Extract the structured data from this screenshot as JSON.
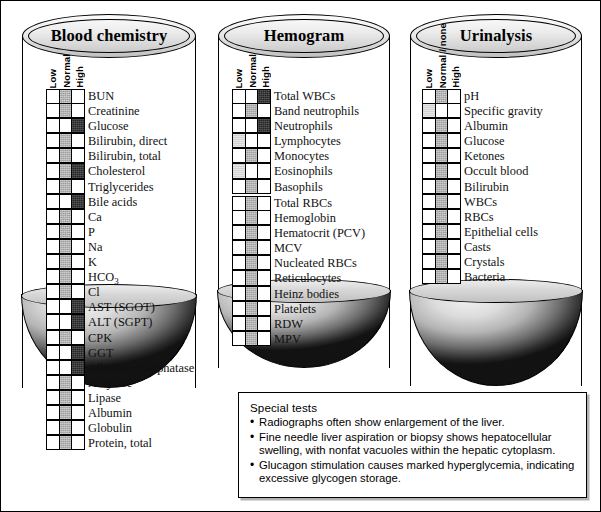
{
  "figure": {
    "title_hidden": "Laboratory test result panels"
  },
  "panels": [
    {
      "id": "blood-chemistry",
      "title": "Blood chemistry",
      "column_headers": [
        "Low",
        "Normal",
        "High"
      ],
      "groups": [
        {
          "rows": [
            {
              "label": "BUN",
              "state": "normal"
            },
            {
              "label": "Creatinine",
              "state": "normal"
            },
            {
              "label": "Glucose",
              "state": "high"
            },
            {
              "label": "Bilirubin, direct",
              "state": "normal"
            },
            {
              "label": "Bilirubin, total",
              "state": "normal"
            },
            {
              "label": "Cholesterol",
              "state": "normal-high"
            },
            {
              "label": "Triglycerides",
              "state": "normal"
            },
            {
              "label": "Bile acids",
              "state": "high"
            },
            {
              "label": "Ca",
              "state": "normal"
            },
            {
              "label": "P",
              "state": "normal"
            },
            {
              "label": "Na",
              "state": "normal"
            },
            {
              "label": "K",
              "state": "normal"
            },
            {
              "label": "HCO3",
              "state": "normal"
            },
            {
              "label": "Cl",
              "state": "normal"
            },
            {
              "label": "AST (SGOT)",
              "state": "high"
            },
            {
              "label": "ALT (SGPT)",
              "state": "high"
            },
            {
              "label": "CPK",
              "state": "normal"
            },
            {
              "label": "GGT",
              "state": "high"
            },
            {
              "label": "Alkaline phosphatase",
              "state": "high"
            },
            {
              "label": "Amylase",
              "state": "normal"
            },
            {
              "label": "Lipase",
              "state": "normal"
            },
            {
              "label": "Albumin",
              "state": "normal"
            },
            {
              "label": "Globulin",
              "state": "normal"
            },
            {
              "label": "Protein, total",
              "state": "normal"
            }
          ]
        }
      ]
    },
    {
      "id": "hemogram",
      "title": "Hemogram",
      "column_headers": [
        "Low",
        "Normal",
        "High"
      ],
      "groups": [
        {
          "rows": [
            {
              "label": "Total WBCs",
              "state": "high"
            },
            {
              "label": "Band neutrophils",
              "state": "normal"
            },
            {
              "label": "Neutrophils",
              "state": "high"
            },
            {
              "label": "Lymphocytes",
              "state": "low-faint"
            },
            {
              "label": "Monocytes",
              "state": "normal"
            },
            {
              "label": "Eosinophils",
              "state": "low-faint"
            },
            {
              "label": "Basophils",
              "state": "normal"
            }
          ]
        },
        {
          "rows": [
            {
              "label": "Total RBCs",
              "state": "normal"
            },
            {
              "label": "Hemoglobin",
              "state": "normal"
            },
            {
              "label": "Hematocrit (PCV)",
              "state": "normal"
            },
            {
              "label": "MCV",
              "state": "normal"
            },
            {
              "label": "Nucleated RBCs",
              "state": "normal"
            },
            {
              "label": "Reticulocytes",
              "state": "normal"
            },
            {
              "label": "Heinz bodies",
              "state": "normal"
            },
            {
              "label": "Platelets",
              "state": "normal"
            },
            {
              "label": "RDW",
              "state": "normal"
            },
            {
              "label": "MPV",
              "state": "normal"
            }
          ]
        }
      ]
    },
    {
      "id": "urinalysis",
      "title": "Urinalysis",
      "column_headers": [
        "Low",
        "Normal / none",
        "High"
      ],
      "groups": [
        {
          "rows": [
            {
              "label": "pH",
              "state": "normal"
            },
            {
              "label": "Specific gravity",
              "state": "low-faint"
            },
            {
              "label": "Albumin",
              "state": "normal"
            },
            {
              "label": "Glucose",
              "state": "normal"
            },
            {
              "label": "Ketones",
              "state": "normal"
            },
            {
              "label": "Occult blood",
              "state": "normal"
            },
            {
              "label": "Bilirubin",
              "state": "normal"
            },
            {
              "label": "WBCs",
              "state": "normal"
            },
            {
              "label": "RBCs",
              "state": "normal"
            },
            {
              "label": "Epithelial cells",
              "state": "normal"
            },
            {
              "label": "Casts",
              "state": "normal"
            },
            {
              "label": "Crystals",
              "state": "normal"
            },
            {
              "label": "Bacteria",
              "state": "normal"
            }
          ]
        }
      ]
    }
  ],
  "special_tests": {
    "title": "Special tests",
    "bullet": "•",
    "items": [
      "Radiographs often show enlargement of the liver.",
      "Fine needle liver aspiration or biopsy shows hepatocellular swelling, with nonfat vacuoles within the hepatic cytoplasm.",
      "Glucagon stimulation causes marked hyperglycemia, indicating excessive glycogen storage."
    ]
  },
  "colors": {
    "ink": "#000000",
    "normal_fill": "#9e9e9e",
    "high_fill": "#252525",
    "faint_fill": "#d2d2d2",
    "empty_fill": "#ffffff"
  }
}
